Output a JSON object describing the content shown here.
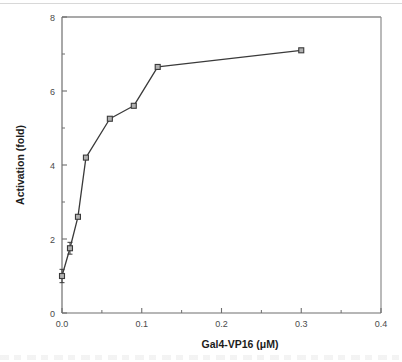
{
  "figure": {
    "background_color": "#ffffff",
    "frame_color": "#8c8c8c",
    "axis_color": "#6e6e6e",
    "line_color": "#3a3a3a",
    "marker_face_color": "#b0b0b0",
    "marker_edge_color": "#3a3a3a",
    "tick_label_color": "#4a4a4a",
    "title_color": "#1c1c1c"
  },
  "chart_data": {
    "type": "line",
    "title": "",
    "xlabel": "Gal4-VP16 (μM)",
    "ylabel": "Activation (fold)",
    "xlim": [
      0.0,
      0.4
    ],
    "ylim": [
      0,
      8
    ],
    "grid": false,
    "legend": "none",
    "marker": "open-square",
    "error_bars": true,
    "x_major_ticks": [
      0.0,
      0.1,
      0.2,
      0.3,
      0.4
    ],
    "x_major_tick_labels": [
      "0.0",
      "0.1",
      "0.2",
      "0.3",
      "0.4"
    ],
    "x_minor_ticks": [
      0.05,
      0.15,
      0.25,
      0.35
    ],
    "y_major_ticks": [
      0,
      2,
      4,
      6,
      8
    ],
    "y_major_tick_labels": [
      "0",
      "2",
      "4",
      "6",
      "8"
    ],
    "y_minor_ticks": [
      1,
      3,
      5,
      7
    ],
    "x": [
      0.0,
      0.01,
      0.02,
      0.03,
      0.06,
      0.09,
      0.12,
      0.3
    ],
    "values": [
      1.0,
      1.75,
      2.6,
      4.2,
      5.25,
      5.6,
      6.65,
      7.1
    ],
    "yerr": [
      0.18,
      0.16,
      0.0,
      0.0,
      0.0,
      0.0,
      0.0,
      0.0
    ],
    "series": [
      {
        "name": "Activation",
        "x": [
          0.0,
          0.01,
          0.02,
          0.03,
          0.06,
          0.09,
          0.12,
          0.3
        ],
        "values": [
          1.0,
          1.75,
          2.6,
          4.2,
          5.25,
          5.6,
          6.65,
          7.1
        ]
      }
    ]
  }
}
